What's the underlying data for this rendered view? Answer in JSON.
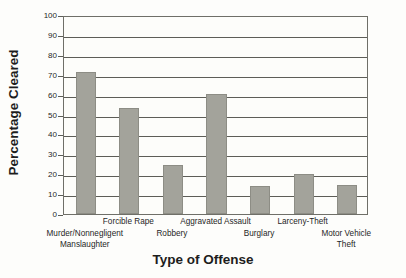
{
  "chart_data": {
    "type": "bar",
    "title": "",
    "xlabel": "Type of Offense",
    "ylabel": "Percentage Cleared",
    "categories": [
      "Murder/Nonnegligent\nManslaughter",
      "Forcible Rape",
      "Robbery",
      "Aggravated Assault",
      "Burglary",
      "Larceny-Theft",
      "Motor Vehicle\nTheft"
    ],
    "category_lines": [
      [
        "Murder/Nonnegligent",
        "Manslaughter"
      ],
      [
        "Forcible Rape"
      ],
      [
        "Robbery"
      ],
      [
        "Aggravated Assault"
      ],
      [
        "Burglary"
      ],
      [
        "Larceny-Theft"
      ],
      [
        "Motor Vehicle",
        "Theft"
      ]
    ],
    "values": [
      71.5,
      53.5,
      24.5,
      60.5,
      14,
      20,
      14.5
    ],
    "ylim": [
      0,
      100
    ],
    "yticks": [
      0,
      10,
      20,
      30,
      40,
      50,
      60,
      70,
      80,
      90,
      100
    ],
    "ytick_labels": [
      "0",
      "10",
      "20",
      "30",
      "40",
      "50",
      "60",
      "70",
      "80",
      "90",
      "100"
    ],
    "grid": true,
    "legend": "none",
    "bar_color": "#a3a39b",
    "axis_color": "#5d5d57",
    "background_color": "#fdfdfa"
  }
}
